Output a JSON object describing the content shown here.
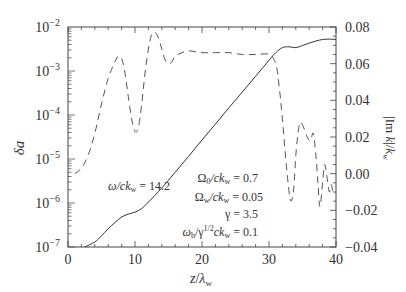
{
  "chart_data": {
    "type": "line",
    "title": "",
    "xlabel": "z/λw",
    "ylabel_left": "δa",
    "ylabel_right": "|Im k|/kw",
    "xlim": [
      0,
      40
    ],
    "ylim_left": [
      1e-07,
      0.01
    ],
    "yscale_left": "log",
    "ylim_right": [
      -0.04,
      0.08
    ],
    "x_ticks": [
      0,
      10,
      20,
      30,
      40
    ],
    "y_ticks_left": [
      "10^-2",
      "10^-3",
      "10^-4",
      "10^-5",
      "10^-6",
      "10^-7"
    ],
    "y_ticks_right": [
      "0.08",
      "0.06",
      "0.04",
      "0.02",
      "0.00",
      "-0.02",
      "-0.04"
    ],
    "grid": false,
    "series": [
      {
        "name": "δa (solid, left log axis)",
        "style": "solid",
        "axis": "left",
        "x": [
          2.5,
          4,
          5,
          6,
          7,
          8,
          9,
          10,
          11,
          12,
          14,
          16,
          18,
          20,
          22,
          24,
          26,
          28,
          30,
          31,
          32,
          33,
          34,
          35,
          36,
          37,
          38,
          39,
          40
        ],
        "y": [
          1e-07,
          1.3e-07,
          1.8e-07,
          2.6e-07,
          3.6e-07,
          4.8e-07,
          5.6e-07,
          6.2e-07,
          7.5e-07,
          1.05e-06,
          2.2e-06,
          5e-06,
          1.15e-05,
          2.7e-05,
          6.2e-05,
          0.000145,
          0.00033,
          0.00076,
          0.00175,
          0.0026,
          0.0034,
          0.00355,
          0.0034,
          0.0038,
          0.0043,
          0.0048,
          0.0052,
          0.0053,
          0.0052
        ]
      },
      {
        "name": "|Im k|/kw (dashed, right axis)",
        "style": "dashed",
        "axis": "right",
        "x": [
          1.0,
          2.0,
          3.0,
          4.0,
          5.0,
          6.0,
          7.0,
          7.5,
          8.0,
          8.5,
          9.0,
          9.5,
          10.0,
          10.5,
          11.0,
          11.5,
          12.0,
          12.5,
          13.0,
          13.5,
          14.0,
          14.5,
          15.0,
          15.5,
          16.0,
          17.0,
          18.0,
          20.0,
          22.0,
          24.0,
          26.0,
          28.0,
          30.0,
          31.0,
          31.5,
          32.0,
          32.5,
          33.0,
          33.3,
          33.7,
          34.0,
          34.4,
          34.7,
          35.2,
          35.7,
          36.2,
          36.6,
          37.0,
          37.3,
          37.6,
          38.0,
          38.3,
          38.7,
          39.0,
          39.3,
          39.6
        ],
        "y": [
          0.0,
          0.003,
          0.01,
          0.022,
          0.038,
          0.052,
          0.061,
          0.064,
          0.063,
          0.055,
          0.042,
          0.03,
          0.023,
          0.025,
          0.038,
          0.055,
          0.068,
          0.076,
          0.077,
          0.074,
          0.068,
          0.062,
          0.06,
          0.061,
          0.064,
          0.066,
          0.067,
          0.066,
          0.066,
          0.066,
          0.065,
          0.065,
          0.065,
          0.06,
          0.048,
          0.03,
          0.008,
          -0.01,
          -0.015,
          -0.008,
          0.01,
          0.024,
          0.028,
          0.025,
          0.02,
          0.018,
          0.022,
          0.01,
          -0.005,
          -0.018,
          -0.005,
          0.005,
          -0.003,
          -0.01,
          -0.006,
          -0.012
        ]
      }
    ],
    "annotations": [
      {
        "text": "ω/ckw = 14.2",
        "x": 10.5,
        "y_px": 185
      },
      {
        "text": "Ω0/ckw = 0.7"
      },
      {
        "text": "Ωw/ckw = 0.05"
      },
      {
        "text": "γ = 3.5"
      },
      {
        "text": "ωb/γ^1/2 ckw = 0.1"
      }
    ]
  },
  "labels": {
    "xlabel_main": "z",
    "xlabel_sep": "/",
    "xlabel_lambda": "λ",
    "xlabel_sub": "w",
    "ylabel_left": "δa",
    "ylabel_right_pre": "|Im ",
    "ylabel_right_k": "k",
    "ylabel_right_mid": "|/",
    "ylabel_right_k2": "k",
    "ylabel_right_sub": "w",
    "omega_label": "ω/ck",
    "omega_sub": "w",
    "omega_value": " = 14.2",
    "param1_pre": "Ω",
    "param1_sub1": "0",
    "param1_mid": "/ck",
    "param1_sub2": "w",
    "param1_val": " = 0.7",
    "param2_pre": "Ω",
    "param2_sub1": "w",
    "param2_mid": "/ck",
    "param2_sub2": "w",
    "param2_val": " = 0.05",
    "param3": "γ = 3.5",
    "param4_pre": "ω",
    "param4_sub1": "b",
    "param4_mid": "/γ",
    "param4_sup": "1/2",
    "param4_ck": "ck",
    "param4_sub2": "w",
    "param4_val": " = 0.1"
  },
  "colors": {
    "axis": "#444444",
    "solid_line": "#333333",
    "dashed_line": "#555555",
    "text": "#333333"
  }
}
